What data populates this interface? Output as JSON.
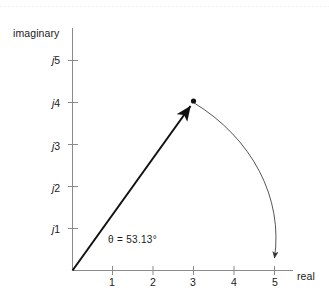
{
  "figure": {
    "background_color": "#ffffff",
    "axis_color": "#8a8a8a",
    "vector_color": "#111111",
    "arc_color": "#4d4d4d",
    "text_color": "#1a1a1a"
  },
  "axes": {
    "imaginary_title": "imaginary",
    "real_title": "real",
    "y_tick_labels": [
      "j1",
      "j2",
      "j3",
      "j4",
      "j5"
    ],
    "x_tick_labels": [
      "1",
      "2",
      "3",
      "4",
      "5"
    ]
  },
  "annotations": {
    "angle": "θ = 53.13°"
  },
  "chart_data": {
    "type": "scatter",
    "title": "",
    "xlabel": "real",
    "ylabel": "imaginary",
    "xlim": [
      0,
      5.6
    ],
    "ylim": [
      0,
      5.6
    ],
    "xticks": [
      1,
      2,
      3,
      4,
      5
    ],
    "yticks": [
      1,
      2,
      3,
      4,
      5
    ],
    "xtick_labels": [
      "1",
      "2",
      "3",
      "4",
      "5"
    ],
    "ytick_labels": [
      "j1",
      "j2",
      "j3",
      "j4",
      "j5"
    ],
    "grid": false,
    "legend": "none",
    "points": [
      {
        "label": "3 + j4",
        "x": 3,
        "y": 4,
        "marker": "dot"
      }
    ],
    "vectors": [
      {
        "label": "phasor",
        "from": [
          0,
          0
        ],
        "to": [
          3,
          4
        ],
        "magnitude": 5,
        "angle_deg": 53.13,
        "arrow": "end"
      }
    ],
    "arcs": [
      {
        "label": "rotation to real axis",
        "center": [
          0,
          0
        ],
        "radius": 5,
        "start_point": [
          3,
          4
        ],
        "end_point": [
          5,
          0
        ],
        "start_angle_deg": 53.13,
        "end_angle_deg": 0,
        "direction": "clockwise",
        "arrow": "end"
      }
    ],
    "annotations": [
      {
        "text": "θ = 53.13°",
        "x": 0.95,
        "y": 0.62
      }
    ]
  }
}
